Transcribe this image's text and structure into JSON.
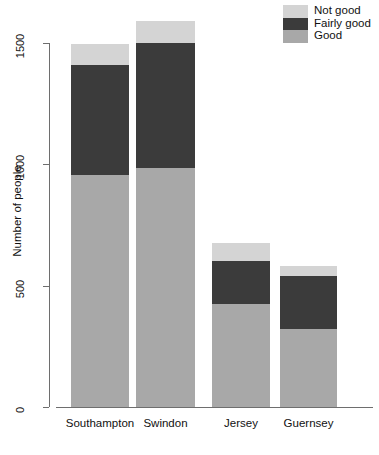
{
  "chart_data": {
    "type": "bar",
    "subtype": "stacked",
    "title": "",
    "xlabel": "",
    "ylabel": "Number of people",
    "categories": [
      "Southampton",
      "Swindon",
      "Jersey",
      "Guernsey"
    ],
    "series": [
      {
        "name": "Good",
        "color": "#a8a8a8",
        "values": [
          955,
          985,
          425,
          320
        ]
      },
      {
        "name": "Fairly good",
        "color": "#3b3b3b",
        "values": [
          455,
          515,
          175,
          220
        ]
      },
      {
        "name": "Not good",
        "color": "#d4d4d4",
        "values": [
          85,
          90,
          75,
          40
        ]
      }
    ],
    "totals": [
      1495,
      1590,
      675,
      580
    ],
    "ylim": [
      0,
      1640
    ],
    "yticks": [
      0,
      500,
      1000,
      1500
    ],
    "ytick_labels": [
      "0",
      "500",
      "1000",
      "1500"
    ],
    "grid": false,
    "legend": {
      "position": "top-right",
      "entries": [
        {
          "label": "Not good",
          "color": "#d4d4d4"
        },
        {
          "label": "Fairly good",
          "color": "#3b3b3b"
        },
        {
          "label": "Good",
          "color": "#a8a8a8"
        }
      ]
    },
    "axis_color": "#6e6e6e"
  }
}
